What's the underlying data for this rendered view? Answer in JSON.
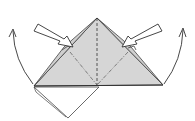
{
  "diagram": {
    "type": "origami-fold-diagram",
    "colors": {
      "paper_fill": "#d4d4d4",
      "paper_fill_light": "#e0e0e0",
      "line": "#333333",
      "background": "#ffffff"
    },
    "elements": {
      "folded_triangle": "Gray pyramid/triangle shape with center valley-fold dashed line",
      "dashed_center_line": "Vertical dashed crease from apex to base",
      "dash_dot_diagonals": "Two dash-dot crease lines from inner points to base center",
      "bottom_square_flap": "White diamond flap hanging below base left",
      "left_push_arrow": "Hollow push arrow pointing into left pocket",
      "right_push_arrow": "Hollow push arrow pointing into right pocket",
      "left_curved_arrow": "Curved arrow swinging up on left side",
      "right_curved_arrow": "Curved arrow swinging up on right side"
    }
  }
}
